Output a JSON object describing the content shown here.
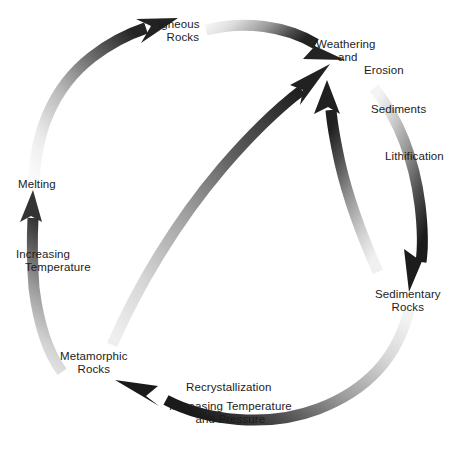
{
  "diagram": {
    "type": "cycle-diagram",
    "background_color": "#ffffff",
    "text_color": "#1c1c1c"
  },
  "nodes": {
    "igneous": {
      "line1": "Igneous",
      "line2": "Rocks"
    },
    "weathering": {
      "line1": "Weathering",
      "line2": "and",
      "line3": "Erosion"
    },
    "sedimentary": {
      "line1": "Sedimentary",
      "line2": "Rocks"
    },
    "metamorphic": {
      "line1": "Metamorphic",
      "line2": "Rocks"
    },
    "melting": {
      "line1": "Melting"
    }
  },
  "process_labels": {
    "sediments": "Sediments",
    "lithification": "Lithification",
    "recrystallization": "Recrystallization",
    "increasing_temp_pressure": {
      "line1": "Increasing Temperature",
      "line2": "and Pressure"
    },
    "increasing_temperature": {
      "line1": "Increasing",
      "line2": "Temperature"
    }
  },
  "arrows": [
    {
      "name": "igneous-to-weathering",
      "from": "Igneous Rocks",
      "to": "Weathering and Erosion",
      "shape": "arc",
      "gradient": {
        "start": "#f2f2f2",
        "end": "#2b2b2b"
      }
    },
    {
      "name": "weathering-to-sedimentary",
      "from": "Weathering and Erosion",
      "to": "Sedimentary Rocks",
      "shape": "arc",
      "via": [
        "Sediments",
        "Lithification"
      ],
      "gradient": {
        "start": "#ededed",
        "end": "#1f1f1f"
      }
    },
    {
      "name": "sedimentary-to-metamorphic",
      "from": "Sedimentary Rocks",
      "to": "Metamorphic Rocks",
      "shape": "arc",
      "via": [
        "Recrystallization",
        "Increasing Temperature and Pressure"
      ],
      "gradient": {
        "start": "#efefef",
        "end": "#1f1f1f"
      }
    },
    {
      "name": "metamorphic-to-melting",
      "from": "Metamorphic Rocks",
      "to": "Melting",
      "shape": "straight-vertical",
      "via": [
        "Increasing Temperature"
      ],
      "gradient": {
        "start": "#d8d8d8",
        "end": "#3a3a3a"
      }
    },
    {
      "name": "melting-to-igneous",
      "from": "Melting",
      "to": "Igneous Rocks",
      "shape": "arc",
      "gradient": {
        "start": "#f4f4f4",
        "end": "#262626"
      }
    },
    {
      "name": "metamorphic-to-weathering",
      "from": "Metamorphic Rocks",
      "to": "Weathering and Erosion",
      "shape": "diagonal-arc",
      "gradient": {
        "start": "#e2e2e2",
        "end": "#242424"
      }
    },
    {
      "name": "sedimentary-to-weathering",
      "from": "Sedimentary Rocks",
      "to": "Weathering and Erosion",
      "shape": "arc",
      "gradient": {
        "start": "#e6e6e6",
        "end": "#232323"
      }
    }
  ]
}
